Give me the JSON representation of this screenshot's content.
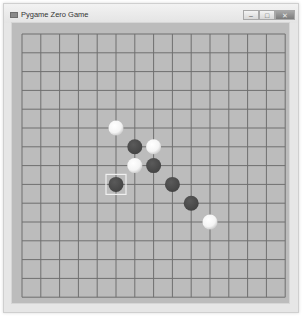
{
  "window": {
    "title": "Pygame Zero Game",
    "controls": {
      "minimize": "–",
      "maximize": "□",
      "close": "✕"
    }
  },
  "board": {
    "grid_lines": 15,
    "origin_x": 22,
    "origin_y": 34,
    "spacing": 18.8,
    "line_color": "#6f6f6f",
    "background": "#bcbcbc",
    "colors": {
      "black": "#444444",
      "white": "#f4f4f4",
      "highlight": "#f0f0f0"
    },
    "stones": [
      {
        "col": 5,
        "row": 5,
        "color": "white"
      },
      {
        "col": 6,
        "row": 6,
        "color": "black"
      },
      {
        "col": 7,
        "row": 6,
        "color": "white"
      },
      {
        "col": 6,
        "row": 7,
        "color": "white"
      },
      {
        "col": 7,
        "row": 7,
        "color": "black"
      },
      {
        "col": 5,
        "row": 8,
        "color": "black",
        "last_move": true
      },
      {
        "col": 8,
        "row": 8,
        "color": "black"
      },
      {
        "col": 9,
        "row": 9,
        "color": "black"
      },
      {
        "col": 10,
        "row": 10,
        "color": "white"
      }
    ]
  }
}
